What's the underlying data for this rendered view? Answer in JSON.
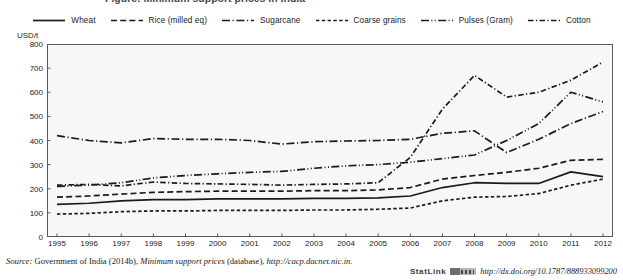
{
  "figure": {
    "clipped_title": "Figure: Minimum support prices in India",
    "y_axis_unit": "USD/t"
  },
  "legend": {
    "position": "top-center",
    "items": [
      {
        "label": "Wheat",
        "style": "solid",
        "icon": "line-solid-icon"
      },
      {
        "label": "Rice (milled eq)",
        "style": "dashed",
        "icon": "line-dashed-icon"
      },
      {
        "label": "Sugarcane",
        "style": "dash-dot",
        "icon": "line-dash-dot-icon"
      },
      {
        "label": "Coarse grains",
        "style": "short-dash",
        "icon": "line-short-dash-icon"
      },
      {
        "label": "Pulses (Gram)",
        "style": "dash-dot-dot",
        "icon": "line-dash-dot-dot-icon"
      },
      {
        "label": "Cotton",
        "style": "long-dash-dot",
        "icon": "line-long-dash-dot-icon"
      }
    ]
  },
  "axes": {
    "y_ticks": [
      "800",
      "700",
      "600",
      "500",
      "400",
      "300",
      "200",
      "100",
      "0"
    ],
    "x_ticks": [
      "1995",
      "1996",
      "1997",
      "1998",
      "1999",
      "2000",
      "2001",
      "2002",
      "2003",
      "2004",
      "2005",
      "2006",
      "2007",
      "2008",
      "2009",
      "2010",
      "2011",
      "2012"
    ]
  },
  "source": {
    "label": "Source:",
    "text_before": " Government of India (2014b), ",
    "italic_title": "Minimum support prices",
    "text_after": " (database), ",
    "url": "http://cacp.dacnet.nic.in."
  },
  "statlink": {
    "word": "StatLink",
    "badge": "statlink-barcode-icon",
    "doi": "http://dx.doi.org/10.1787/888933099200"
  },
  "chart_data": {
    "type": "line",
    "title": "Minimum support prices in India",
    "xlabel": "",
    "ylabel": "USD/t",
    "ylim": [
      0,
      800
    ],
    "ytick_step": 100,
    "grid": false,
    "legend_position": "top",
    "x": [
      1995,
      1996,
      1997,
      1998,
      1999,
      2000,
      2001,
      2002,
      2003,
      2004,
      2005,
      2006,
      2007,
      2008,
      2009,
      2010,
      2011,
      2012
    ],
    "series": [
      {
        "name": "Wheat",
        "style": "solid",
        "values": [
          135,
          140,
          150,
          155,
          155,
          158,
          158,
          158,
          160,
          160,
          162,
          170,
          205,
          225,
          222,
          222,
          270,
          250
        ]
      },
      {
        "name": "Rice (milled eq)",
        "style": "dashed",
        "values": [
          165,
          170,
          178,
          185,
          188,
          190,
          190,
          190,
          192,
          192,
          195,
          205,
          240,
          255,
          268,
          285,
          318,
          322
        ]
      },
      {
        "name": "Sugarcane",
        "style": "dash-dot",
        "values": [
          420,
          400,
          390,
          408,
          405,
          405,
          400,
          385,
          395,
          398,
          400,
          405,
          430,
          440,
          350,
          405,
          470,
          520
        ]
      },
      {
        "name": "Coarse grains",
        "style": "short-dash",
        "values": [
          95,
          98,
          105,
          108,
          108,
          110,
          110,
          110,
          112,
          112,
          115,
          120,
          150,
          165,
          168,
          180,
          215,
          240
        ]
      },
      {
        "name": "Pulses (Gram)",
        "style": "dash-dot-dot",
        "values": [
          210,
          215,
          225,
          245,
          255,
          262,
          268,
          272,
          285,
          295,
          300,
          310,
          325,
          340,
          400,
          470,
          600,
          560
        ]
      },
      {
        "name": "Cotton",
        "style": "long-dash-dot",
        "values": [
          215,
          218,
          212,
          228,
          222,
          220,
          218,
          215,
          218,
          220,
          225,
          330,
          530,
          670,
          580,
          600,
          650,
          725
        ]
      }
    ]
  }
}
